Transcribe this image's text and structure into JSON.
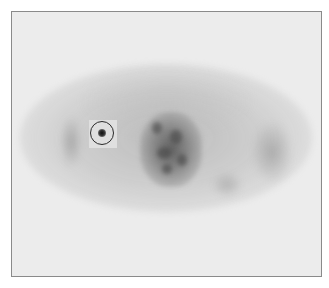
{
  "image": {
    "description": "Axial PET scan slice in grayscale with a circular region-of-interest marker over a focal hot spot",
    "colors": {
      "background": "#ececec",
      "frame_border": "#8a8a8a",
      "roi_marker": "#2a2a2a"
    },
    "roi": {
      "shape": "circle",
      "label": ""
    }
  }
}
